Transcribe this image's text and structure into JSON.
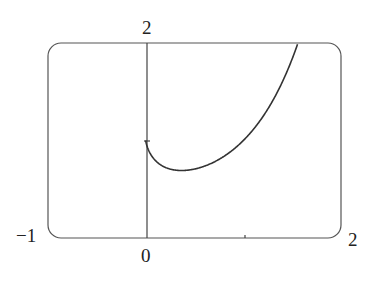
{
  "chart_data": {
    "type": "line",
    "title": "",
    "xlabel": "",
    "ylabel": "",
    "xlim": [
      -1,
      2
    ],
    "ylim": [
      0,
      2
    ],
    "grid": false,
    "legend": null,
    "function": "y = x^x",
    "series": [
      {
        "name": "y = x^x",
        "x": [
          0,
          0.05,
          0.1,
          0.2,
          0.3,
          0.368,
          0.5,
          0.7,
          0.9,
          1.0,
          1.2,
          1.4,
          1.56
        ],
        "values": [
          1.0,
          0.86,
          0.79,
          0.72,
          0.7,
          0.69,
          0.71,
          0.78,
          0.91,
          1.0,
          1.24,
          1.6,
          2.0
        ]
      }
    ],
    "tick_labels": {
      "x_left": "−1",
      "x_origin": "0",
      "x_right": "2",
      "y_top": "2"
    },
    "ticks": {
      "x": [
        1
      ],
      "y": [
        1
      ]
    }
  },
  "colors": {
    "curve": "#333333",
    "frame": "#555555",
    "axis": "#444444"
  }
}
